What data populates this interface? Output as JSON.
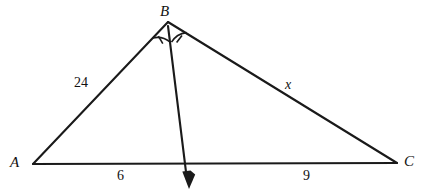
{
  "figure": {
    "kind": "geometry-diagram",
    "background_color": "#ffffff",
    "stroke_color": "#1a1a1a"
  },
  "vertices": {
    "A": {
      "label": "A",
      "x": 33,
      "y": 164
    },
    "B": {
      "label": "B",
      "x": 168,
      "y": 22
    },
    "C": {
      "label": "C",
      "x": 397,
      "y": 163
    },
    "D": {
      "label": "",
      "x": 185,
      "y": 163
    }
  },
  "segments": {
    "AB": {
      "name": "segment-ab",
      "length_label": "24"
    },
    "BC": {
      "name": "segment-bc",
      "length_label": "x"
    },
    "AD": {
      "name": "segment-ad",
      "length_label": "6"
    },
    "DC": {
      "name": "segment-dc",
      "length_label": "9"
    },
    "bisector": {
      "name": "angle-bisector-bd",
      "length_label": ""
    }
  },
  "angle_marks": {
    "left": {
      "name": "angle-abd-arc",
      "ticks": 1
    },
    "right": {
      "name": "angle-dbc-arc",
      "ticks": 1
    }
  },
  "arrow": {
    "name": "bisector-arrowhead",
    "tip_x": 189,
    "tip_y": 188
  }
}
